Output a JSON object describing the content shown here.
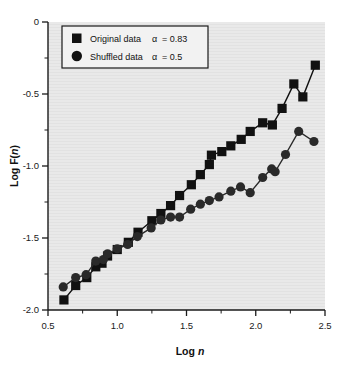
{
  "figure": {
    "background_color": "#ffffff",
    "plot_background_color": "#e8e8e8",
    "axis_color": "#1a1a1a",
    "series_color": "#111111"
  },
  "axes": {
    "xlabel_prefix": "Log ",
    "xlabel_italic": "n",
    "ylabel_prefix": "Log F(",
    "ylabel_italic": "n",
    "ylabel_suffix": ")",
    "xticks": [
      "0.5",
      "1.0",
      "1.5",
      "2.0",
      "2.5"
    ],
    "yticks": [
      "0",
      "-0.5",
      "-1.0",
      "-1.5",
      "-2.0"
    ]
  },
  "legend": {
    "entries": [
      {
        "marker": "square-marker",
        "label": "Original data",
        "alpha_symbol": "α",
        "alpha_text": "= 0.83"
      },
      {
        "marker": "circle-marker",
        "label": "Shuffled data",
        "alpha_symbol": "α",
        "alpha_text": "= 0.5"
      }
    ]
  },
  "chart_data": {
    "type": "line",
    "title": "",
    "xlabel": "Log n",
    "ylabel": "Log F(n)",
    "xlim": [
      0.5,
      2.5
    ],
    "ylim": [
      -2.0,
      0.0
    ],
    "xticks": [
      0.5,
      1.0,
      1.5,
      2.0,
      2.5
    ],
    "yticks": [
      0.0,
      -0.5,
      -1.0,
      -1.5,
      -2.0
    ],
    "minor_tick_step": 0.25,
    "grid": false,
    "legend_position": "upper-left",
    "annotations": [
      "Original data alpha = 0.83",
      "Shuffled data alpha = 0.5"
    ],
    "series": [
      {
        "name": "Original data",
        "alpha": 0.83,
        "marker": "square",
        "color": "#111111",
        "points": [
          [
            0.615,
            -1.93
          ],
          [
            0.7,
            -1.83
          ],
          [
            0.78,
            -1.775
          ],
          [
            0.845,
            -1.7
          ],
          [
            0.89,
            -1.675
          ],
          [
            0.93,
            -1.625
          ],
          [
            1.0,
            -1.58
          ],
          [
            1.08,
            -1.53
          ],
          [
            1.15,
            -1.46
          ],
          [
            1.25,
            -1.38
          ],
          [
            1.315,
            -1.33
          ],
          [
            1.385,
            -1.275
          ],
          [
            1.45,
            -1.205
          ],
          [
            1.535,
            -1.13
          ],
          [
            1.6,
            -1.06
          ],
          [
            1.665,
            -0.99
          ],
          [
            1.68,
            -0.925
          ],
          [
            1.755,
            -0.9
          ],
          [
            1.82,
            -0.86
          ],
          [
            1.895,
            -0.815
          ],
          [
            1.96,
            -0.76
          ],
          [
            2.05,
            -0.7
          ],
          [
            2.12,
            -0.715
          ],
          [
            2.19,
            -0.6
          ],
          [
            2.275,
            -0.43
          ],
          [
            2.34,
            -0.52
          ],
          [
            2.43,
            -0.3
          ]
        ]
      },
      {
        "name": "Shuffled data",
        "alpha": 0.5,
        "marker": "circle",
        "color": "#2a2a2a",
        "points": [
          [
            0.61,
            -1.84
          ],
          [
            0.7,
            -1.775
          ],
          [
            0.775,
            -1.755
          ],
          [
            0.845,
            -1.66
          ],
          [
            0.9,
            -1.65
          ],
          [
            0.93,
            -1.61
          ],
          [
            1.0,
            -1.575
          ],
          [
            1.075,
            -1.545
          ],
          [
            1.145,
            -1.49
          ],
          [
            1.245,
            -1.43
          ],
          [
            1.315,
            -1.375
          ],
          [
            1.385,
            -1.355
          ],
          [
            1.45,
            -1.355
          ],
          [
            1.53,
            -1.3
          ],
          [
            1.6,
            -1.265
          ],
          [
            1.665,
            -1.24
          ],
          [
            1.735,
            -1.215
          ],
          [
            1.82,
            -1.175
          ],
          [
            1.89,
            -1.145
          ],
          [
            1.96,
            -1.185
          ],
          [
            2.05,
            -1.08
          ],
          [
            2.115,
            -1.02
          ],
          [
            2.14,
            -1.04
          ],
          [
            2.215,
            -0.92
          ],
          [
            2.31,
            -0.76
          ],
          [
            2.42,
            -0.83
          ]
        ]
      }
    ]
  }
}
